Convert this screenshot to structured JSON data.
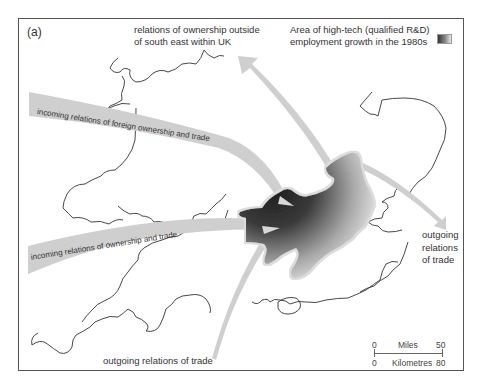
{
  "figure": {
    "panel_label": "(a)",
    "legend": {
      "line1": "Area of high-tech (qualified R&D)",
      "line2": "employment growth in the 1980s",
      "swatch_gradient": [
        "#333333",
        "#888888",
        "#e8e8e8"
      ]
    },
    "annotations": {
      "north_line1": "relations of ownership outside",
      "north_line2": "of south east  within UK",
      "foreign_incoming": "incoming relations of foreign ownership and trade",
      "west_incoming": "incoming relations of ownership and trade",
      "east_outgoing_line1": "outgoing",
      "east_outgoing_line2": "relations",
      "east_outgoing_line3": "of trade",
      "south_outgoing": "outgoing relations of trade"
    },
    "scale_bar": {
      "miles_label": "Miles",
      "miles_start": "0",
      "miles_end": "50",
      "km_label": "Kilometres",
      "km_start": "0",
      "km_end": "80"
    },
    "colors": {
      "arrow_fill": "#cfcfcf",
      "high_tech_dark": "#2a2a2a",
      "coastline": "#333333",
      "frame": "#555555"
    }
  }
}
